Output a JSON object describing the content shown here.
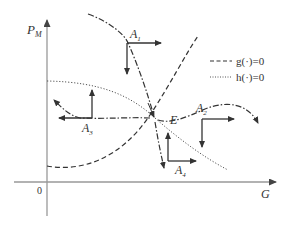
{
  "axes": {
    "y_label": "P",
    "y_label_sub": "M",
    "x_label": "G",
    "origin_label": "0"
  },
  "legend": {
    "items": [
      {
        "style": "dashed",
        "label": "g(·)=0"
      },
      {
        "style": "dotted",
        "label": "h(·)=0"
      }
    ]
  },
  "points": {
    "equilibrium": "E",
    "A1": {
      "base": "A",
      "sub": "1"
    },
    "A2": {
      "base": "A",
      "sub": "2"
    },
    "A3": {
      "base": "A",
      "sub": "3"
    },
    "A4": {
      "base": "A",
      "sub": "4"
    }
  },
  "colors": {
    "axis": "#999999",
    "curve": "#333333",
    "arrow": "#333333"
  }
}
